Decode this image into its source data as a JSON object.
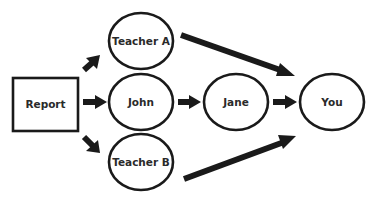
{
  "diagram": {
    "type": "flow",
    "colors": {
      "stroke": "#1a1a1a",
      "text": "#2a2a2a",
      "background": "#ffffff"
    },
    "nodes": [
      {
        "id": "report",
        "label": "Report",
        "shape": "rectangle"
      },
      {
        "id": "teacher_a",
        "label": "Teacher A",
        "shape": "ellipse"
      },
      {
        "id": "john",
        "label": "John",
        "shape": "ellipse"
      },
      {
        "id": "teacher_b",
        "label": "Teacher B",
        "shape": "ellipse"
      },
      {
        "id": "jane",
        "label": "Jane",
        "shape": "ellipse"
      },
      {
        "id": "you",
        "label": "You",
        "shape": "ellipse"
      }
    ],
    "edges": [
      {
        "from": "report",
        "to": "teacher_a"
      },
      {
        "from": "report",
        "to": "john"
      },
      {
        "from": "report",
        "to": "teacher_b"
      },
      {
        "from": "teacher_a",
        "to": "you"
      },
      {
        "from": "john",
        "to": "jane"
      },
      {
        "from": "jane",
        "to": "you"
      },
      {
        "from": "teacher_b",
        "to": "you"
      }
    ]
  }
}
